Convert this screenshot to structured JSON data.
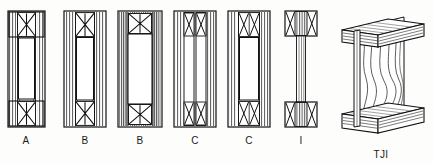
{
  "figure": {
    "background_color": "#fdfdfb",
    "line_color": "#111111",
    "hatch_color": "#5b5b5b",
    "caption_color": "#1a1a1a"
  },
  "captions": {
    "a": "A",
    "b1": "B",
    "b2": "B",
    "c1": "C",
    "c2": "C",
    "i": "I",
    "tji": "TJI"
  },
  "sections": [
    {
      "id": "section-a",
      "label": "A",
      "kind": "cross-section",
      "x": 8,
      "y": 11,
      "width": 37,
      "height": 116,
      "flange_count": 2,
      "web_count": 1,
      "brace": "single-x",
      "side_hatch": "vertical-lines",
      "caption_x": 26,
      "caption_y": 141
    },
    {
      "id": "section-b1",
      "label": "B",
      "kind": "cross-section",
      "x": 64,
      "y": 11,
      "width": 42,
      "height": 116,
      "flange_count": 2,
      "web_count": 1,
      "brace": "single-x",
      "side_hatch": "vertical-lines",
      "caption_x": 85,
      "caption_y": 141
    },
    {
      "id": "section-b2",
      "label": "B",
      "kind": "cross-section",
      "x": 118,
      "y": 11,
      "width": 44,
      "height": 116,
      "flange_count": 2,
      "web_count": 1,
      "brace": "single-x",
      "side_hatch": "vertical-lines-dense",
      "caption_x": 140,
      "caption_y": 141
    },
    {
      "id": "section-c1",
      "label": "C",
      "kind": "cross-section",
      "x": 174,
      "y": 11,
      "width": 42,
      "height": 116,
      "flange_count": 2,
      "web_count": 2,
      "brace": "double-x",
      "side_hatch": "vertical-lines",
      "caption_x": 195,
      "caption_y": 141
    },
    {
      "id": "section-c2",
      "label": "C",
      "kind": "cross-section",
      "x": 228,
      "y": 11,
      "width": 42,
      "height": 116,
      "flange_count": 2,
      "web_count": 2,
      "brace": "double-x",
      "side_hatch": "vertical-lines",
      "caption_x": 249,
      "caption_y": 141
    },
    {
      "id": "section-i",
      "label": "I",
      "kind": "i-beam-section",
      "x": 285,
      "y": 11,
      "width": 32,
      "height": 116,
      "flange_count": 2,
      "web_count": 1,
      "brace": "double-x",
      "side_hatch": "none",
      "caption_x": 301,
      "caption_y": 141
    },
    {
      "id": "joist-tji",
      "label": "TJI",
      "kind": "isometric-i-joist",
      "x": 335,
      "y": 6,
      "width": 96,
      "height": 132,
      "flange_count": 2,
      "web_count": 1,
      "brace": "none",
      "side_hatch": "wood-grain",
      "caption_x": 381,
      "caption_y": 155
    }
  ]
}
